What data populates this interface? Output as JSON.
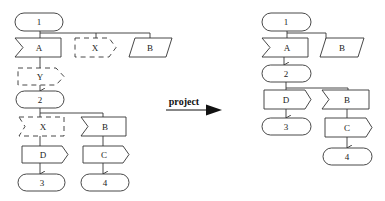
{
  "diagram": {
    "transformation_label": "project",
    "left_graph": {
      "nodes": [
        {
          "id": "1",
          "label": "1",
          "shape": "terminal",
          "style": "solid"
        },
        {
          "id": "A",
          "label": "A",
          "shape": "receive-flag",
          "style": "solid"
        },
        {
          "id": "X_top",
          "label": "X",
          "shape": "send-flag",
          "style": "dashed"
        },
        {
          "id": "B_top",
          "label": "B",
          "shape": "parallelogram",
          "style": "solid"
        },
        {
          "id": "Y",
          "label": "Y",
          "shape": "send-flag",
          "style": "dashed"
        },
        {
          "id": "2",
          "label": "2",
          "shape": "terminal",
          "style": "solid"
        },
        {
          "id": "X_mid",
          "label": "X",
          "shape": "receive-flag",
          "style": "dashed"
        },
        {
          "id": "B_mid",
          "label": "B",
          "shape": "receive-flag",
          "style": "solid"
        },
        {
          "id": "D",
          "label": "D",
          "shape": "send-flag",
          "style": "solid"
        },
        {
          "id": "C",
          "label": "C",
          "shape": "send-flag",
          "style": "solid"
        },
        {
          "id": "3",
          "label": "3",
          "shape": "terminal",
          "style": "solid"
        },
        {
          "id": "4",
          "label": "4",
          "shape": "terminal",
          "style": "solid"
        }
      ],
      "edges": [
        [
          "1",
          "A"
        ],
        [
          "1",
          "X_top"
        ],
        [
          "1",
          "B_top"
        ],
        [
          "A",
          "Y"
        ],
        [
          "Y",
          "2"
        ],
        [
          "2",
          "X_mid"
        ],
        [
          "2",
          "B_mid"
        ],
        [
          "X_mid",
          "D"
        ],
        [
          "B_mid",
          "C"
        ],
        [
          "D",
          "3"
        ],
        [
          "C",
          "4"
        ]
      ]
    },
    "right_graph": {
      "nodes": [
        {
          "id": "1",
          "label": "1",
          "shape": "terminal",
          "style": "solid"
        },
        {
          "id": "A",
          "label": "A",
          "shape": "receive-flag",
          "style": "solid"
        },
        {
          "id": "B_top",
          "label": "B",
          "shape": "parallelogram",
          "style": "solid"
        },
        {
          "id": "2",
          "label": "2",
          "shape": "terminal",
          "style": "solid"
        },
        {
          "id": "D",
          "label": "D",
          "shape": "send-flag",
          "style": "solid"
        },
        {
          "id": "B_mid",
          "label": "B",
          "shape": "receive-flag",
          "style": "solid"
        },
        {
          "id": "3",
          "label": "3",
          "shape": "terminal",
          "style": "solid"
        },
        {
          "id": "C",
          "label": "C",
          "shape": "send-flag",
          "style": "solid"
        },
        {
          "id": "4",
          "label": "4",
          "shape": "terminal",
          "style": "solid"
        }
      ],
      "edges": [
        [
          "1",
          "A"
        ],
        [
          "1",
          "B_top"
        ],
        [
          "A",
          "2"
        ],
        [
          "2",
          "D"
        ],
        [
          "2",
          "B_mid"
        ],
        [
          "D",
          "3"
        ],
        [
          "B_mid",
          "C"
        ],
        [
          "C",
          "4"
        ]
      ]
    }
  },
  "labels": {
    "L1": "1",
    "LA": "A",
    "LXt": "X",
    "LBt": "B",
    "LY": "Y",
    "L2": "2",
    "LXm": "X",
    "LBm": "B",
    "LD": "D",
    "LC": "C",
    "L3": "3",
    "L4": "4",
    "R1": "1",
    "RA": "A",
    "RBt": "B",
    "R2": "2",
    "RD": "D",
    "RBm": "B",
    "R3": "3",
    "RC": "C",
    "R4": "4",
    "arrow": "project"
  }
}
